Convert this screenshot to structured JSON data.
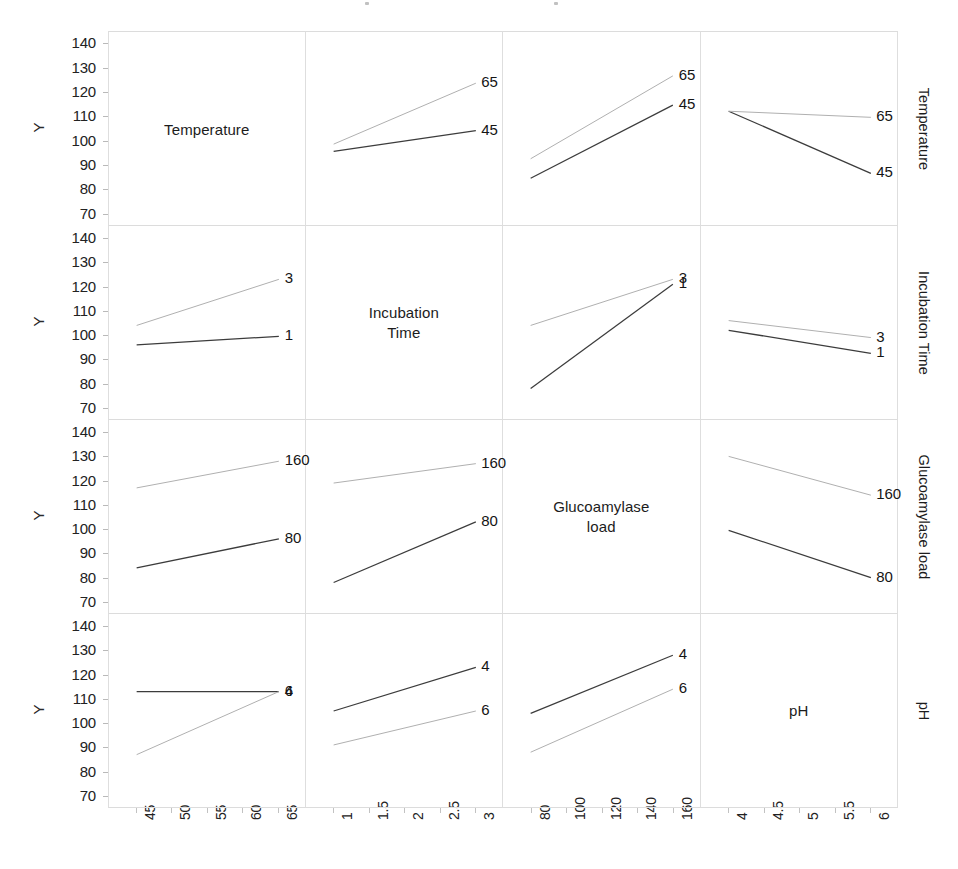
{
  "axis": {
    "y_label": "Y",
    "y_ticks": [
      140,
      130,
      120,
      110,
      100,
      90,
      80,
      70
    ],
    "ylim": [
      65,
      145
    ]
  },
  "factors": [
    {
      "name": "Temperature",
      "x_ticks": [
        "45",
        "50",
        "55",
        "60",
        "65"
      ],
      "xlim": [
        45,
        65
      ],
      "levels": [
        "45",
        "65"
      ]
    },
    {
      "name": "Incubation Time",
      "diag_label": "Incubation\nTime",
      "x_ticks": [
        "1",
        "1.5",
        "2",
        "2.5",
        "3"
      ],
      "xlim": [
        1,
        3
      ],
      "levels": [
        "1",
        "3"
      ]
    },
    {
      "name": "Glucoamylase load",
      "diag_label": "Glucoamylase\nload",
      "x_ticks": [
        "80",
        "100",
        "120",
        "140",
        "160"
      ],
      "xlim": [
        80,
        160
      ],
      "levels": [
        "80",
        "160"
      ]
    },
    {
      "name": "pH",
      "x_ticks": [
        "4",
        "4.5",
        "5",
        "5.5",
        "6"
      ],
      "xlim": [
        4,
        6
      ],
      "levels": [
        "4",
        "6"
      ]
    }
  ],
  "chart_data": {
    "type": "line",
    "subtype": "interaction-plot-matrix",
    "title": "",
    "xlabel": "",
    "ylabel": "Y",
    "ylim": [
      65,
      145
    ],
    "grid": false,
    "legend_position": "line-end-labels",
    "row_factors": [
      "Temperature",
      "Incubation Time",
      "Glucoamylase load",
      "pH"
    ],
    "col_factors": [
      "Temperature",
      "Incubation Time",
      "Glucoamylase load",
      "pH"
    ],
    "panels": [
      {
        "row": 0,
        "col": 0,
        "diagonal": true,
        "label": "Temperature"
      },
      {
        "row": 0,
        "col": 1,
        "diagonal": false,
        "row_factor": "Temperature",
        "col_factor": "Incubation Time",
        "x": [
          1,
          3
        ],
        "series": [
          {
            "name": "45",
            "values": [
              96.0,
              104.5
            ]
          },
          {
            "name": "65",
            "values": [
              99.0,
              124.0
            ]
          }
        ]
      },
      {
        "row": 0,
        "col": 2,
        "diagonal": false,
        "row_factor": "Temperature",
        "col_factor": "Glucoamylase load",
        "x": [
          80,
          160
        ],
        "series": [
          {
            "name": "45",
            "values": [
              85.0,
              115.0
            ]
          },
          {
            "name": "65",
            "values": [
              93.0,
              127.0
            ]
          }
        ]
      },
      {
        "row": 0,
        "col": 3,
        "diagonal": false,
        "row_factor": "Temperature",
        "col_factor": "pH",
        "x": [
          4,
          6
        ],
        "series": [
          {
            "name": "45",
            "values": [
              112.5,
              87.0
            ]
          },
          {
            "name": "65",
            "values": [
              112.5,
              110.0
            ]
          }
        ]
      },
      {
        "row": 1,
        "col": 0,
        "diagonal": false,
        "row_factor": "Incubation Time",
        "col_factor": "Temperature",
        "x": [
          45,
          65
        ],
        "series": [
          {
            "name": "1",
            "values": [
              96.0,
              99.5
            ]
          },
          {
            "name": "3",
            "values": [
              104.0,
              123.0
            ]
          }
        ]
      },
      {
        "row": 1,
        "col": 1,
        "diagonal": true,
        "label": "Incubation Time"
      },
      {
        "row": 1,
        "col": 2,
        "diagonal": false,
        "row_factor": "Incubation Time",
        "col_factor": "Glucoamylase load",
        "x": [
          80,
          160
        ],
        "series": [
          {
            "name": "1",
            "values": [
              78.0,
              121.0
            ]
          },
          {
            "name": "3",
            "values": [
              104.0,
              123.0
            ]
          }
        ]
      },
      {
        "row": 1,
        "col": 3,
        "diagonal": false,
        "row_factor": "Incubation Time",
        "col_factor": "pH",
        "x": [
          4,
          6
        ],
        "series": [
          {
            "name": "1",
            "values": [
              102.0,
              92.5
            ]
          },
          {
            "name": "3",
            "values": [
              106.0,
              99.0
            ]
          }
        ]
      },
      {
        "row": 2,
        "col": 0,
        "diagonal": false,
        "row_factor": "Glucoamylase load",
        "col_factor": "Temperature",
        "x": [
          45,
          65
        ],
        "series": [
          {
            "name": "80",
            "values": [
              84.0,
              96.0
            ]
          },
          {
            "name": "160",
            "values": [
              117.0,
              128.0
            ]
          }
        ]
      },
      {
        "row": 2,
        "col": 1,
        "diagonal": false,
        "row_factor": "Glucoamylase load",
        "col_factor": "Incubation Time",
        "x": [
          1,
          3
        ],
        "series": [
          {
            "name": "80",
            "values": [
              78.0,
              103.0
            ]
          },
          {
            "name": "160",
            "values": [
              119.0,
              127.0
            ]
          }
        ]
      },
      {
        "row": 2,
        "col": 2,
        "diagonal": true,
        "label": "Glucoamylase load"
      },
      {
        "row": 2,
        "col": 3,
        "diagonal": false,
        "row_factor": "Glucoamylase load",
        "col_factor": "pH",
        "x": [
          4,
          6
        ],
        "series": [
          {
            "name": "80",
            "values": [
              99.5,
              80.0
            ]
          },
          {
            "name": "160",
            "values": [
              130.0,
              114.0
            ]
          }
        ]
      },
      {
        "row": 3,
        "col": 0,
        "diagonal": false,
        "row_factor": "pH",
        "col_factor": "Temperature",
        "x": [
          45,
          65
        ],
        "series": [
          {
            "name": "4",
            "values": [
              113.0,
              113.0
            ]
          },
          {
            "name": "6",
            "values": [
              87.0,
              113.0
            ]
          }
        ]
      },
      {
        "row": 3,
        "col": 1,
        "diagonal": false,
        "row_factor": "pH",
        "col_factor": "Incubation Time",
        "x": [
          1,
          3
        ],
        "series": [
          {
            "name": "4",
            "values": [
              105.0,
              123.0
            ]
          },
          {
            "name": "6",
            "values": [
              91.0,
              105.0
            ]
          }
        ]
      },
      {
        "row": 3,
        "col": 2,
        "diagonal": false,
        "row_factor": "pH",
        "col_factor": "Glucoamylase load",
        "x": [
          80,
          160
        ],
        "series": [
          {
            "name": "4",
            "values": [
              104.0,
              128.0
            ]
          },
          {
            "name": "6",
            "values": [
              88.0,
              114.0
            ]
          }
        ]
      },
      {
        "row": 3,
        "col": 3,
        "diagonal": true,
        "label": "pH"
      }
    ]
  },
  "colors": {
    "line_low": "#3c3c3c",
    "line_high": "#b0b0b0",
    "frame": "#dedede",
    "text": "#1c1c1c"
  }
}
